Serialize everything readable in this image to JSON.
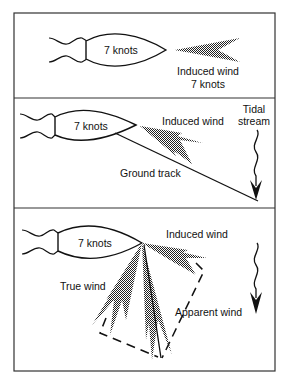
{
  "figure": {
    "panels": [
      {
        "id": "panel-1",
        "boat_label": "7 knots",
        "induced_wind_label_line1": "Induced wind",
        "induced_wind_label_line2": "7 knots"
      },
      {
        "id": "panel-2",
        "boat_label": "7 knots",
        "induced_wind_label": "Induced wind",
        "tidal_label_line1": "Tidal",
        "tidal_label_line2": "stream",
        "ground_track_label": "Ground track"
      },
      {
        "id": "panel-3",
        "boat_label": "7 knots",
        "induced_wind_label": "Induced wind",
        "true_wind_label": "True wind",
        "apparent_wind_label": "Apparent wind"
      }
    ],
    "colors": {
      "ink": "#111111",
      "frame": "#333333",
      "background": "#ffffff"
    }
  }
}
